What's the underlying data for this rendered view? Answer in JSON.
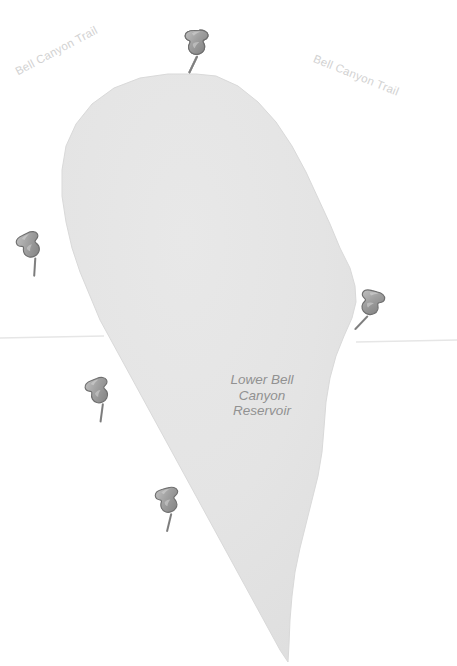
{
  "map": {
    "background_color": "#ffffff",
    "water_fill_color": "#e4e4e4",
    "water_edge_color": "#d8d8d8",
    "boundary_line_color": "#e6e6e6",
    "pin_body_color": "#9a9a9a",
    "pin_outline_color": "#6f6f6f",
    "pin_highlight_color": "#b6b6b6",
    "labels": {
      "trail_left": "Bell Canyon Trail",
      "trail_right": "Bell Canyon Trail",
      "reservoir_name": "Lower Bell Canyon\nReservoir",
      "reservoir_line1": "Lower Bell",
      "reservoir_line2": "Canyon",
      "reservoir_line3": "Reservoir"
    },
    "label_colors": {
      "trail": "#d2d2d2",
      "reservoir": "#919191"
    },
    "pins": [
      {
        "name": "map-pin-1",
        "x": 178,
        "y": 25,
        "rotation": -4
      },
      {
        "name": "map-pin-2",
        "x": 14,
        "y": 226,
        "rotation": -26
      },
      {
        "name": "map-pin-3",
        "x": 350,
        "y": 286,
        "rotation": 14
      },
      {
        "name": "map-pin-4",
        "x": 82,
        "y": 372,
        "rotation": -22
      },
      {
        "name": "map-pin-5",
        "x": 151,
        "y": 482,
        "rotation": -16
      },
      {
        "name": "map-pin-6",
        "x": 178,
        "y": 25,
        "rotation": -4
      }
    ],
    "pin_count": 6,
    "water_polygon": "M 196 74 L 216 76 L 238 86 L 258 102 L 276 122 L 292 146 L 306 172 L 318 198 L 330 224 L 340 248 L 350 268 L 355 286 L 356 302 L 352 318 L 344 336 L 336 356 L 330 378 L 326 402 L 324 428 L 322 452 L 318 476 L 312 500 L 306 524 L 300 548 L 295 572 L 292 596 L 290 620 L 289 644 L 288 662 L 280 650 L 268 628 L 256 606 L 244 584 L 232 562 L 220 540 L 208 518 L 196 496 L 184 474 L 172 452 L 160 430 L 148 408 L 136 386 L 124 364 L 112 342 L 100 320 L 90 296 L 80 272 L 72 248 L 66 222 L 62 196 L 62 170 L 66 146 L 76 124 L 92 104 L 114 88 L 140 78 L 168 74 Z",
    "boundary_left_line": {
      "x1": 0,
      "y1": 338,
      "x2": 104,
      "y2": 336
    },
    "boundary_right_line": {
      "x1": 356,
      "y1": 342,
      "x2": 457,
      "y2": 340
    }
  }
}
